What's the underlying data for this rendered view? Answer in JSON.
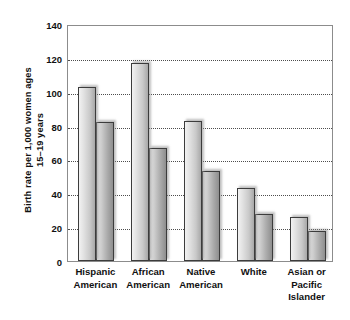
{
  "chart_data": {
    "type": "bar",
    "title": "",
    "subtitle": "",
    "xlabel": "",
    "ylabel_lines": [
      "Birth rate per 1,000 women ages",
      "15–19 years"
    ],
    "ylabel": "Birth rate per 1,000 women ages 15–19 years",
    "ylim": [
      0,
      140
    ],
    "ytick_step": 20,
    "yticks": [
      0,
      20,
      40,
      60,
      80,
      100,
      120,
      140
    ],
    "ytick_labels": [
      "0",
      "20",
      "40",
      "60",
      "80",
      "100",
      "120",
      "140"
    ],
    "grid": true,
    "grid_style": "dotted-horizontal",
    "legend": false,
    "legend_position": "none",
    "categories": [
      {
        "lines": [
          "Hispanic",
          "American"
        ]
      },
      {
        "lines": [
          "African",
          "American"
        ]
      },
      {
        "lines": [
          "Native",
          "American"
        ]
      },
      {
        "lines": [
          "White"
        ]
      },
      {
        "lines": [
          "Asian or",
          "Pacific",
          "Islander"
        ]
      }
    ],
    "category_labels": [
      "Hispanic American",
      "African American",
      "Native American",
      "White",
      "Asian or Pacific Islander"
    ],
    "series": [
      {
        "name": "series-1",
        "values": [
          103,
          117,
          83,
          43,
          26
        ]
      },
      {
        "name": "series-2",
        "values": [
          82,
          67,
          53,
          28,
          18
        ]
      }
    ],
    "colors": {
      "series_1_light": "#f2f2f2",
      "series_1_dark": "#a8a8a8",
      "series_2_light": "#e0e0e0",
      "series_2_dark": "#8e8e8e",
      "bar_outline": "#3c3c3c",
      "gridline": "#4d4d4d",
      "axis": "#8c8c8c",
      "text": "#111111",
      "background": "#ffffff"
    }
  }
}
